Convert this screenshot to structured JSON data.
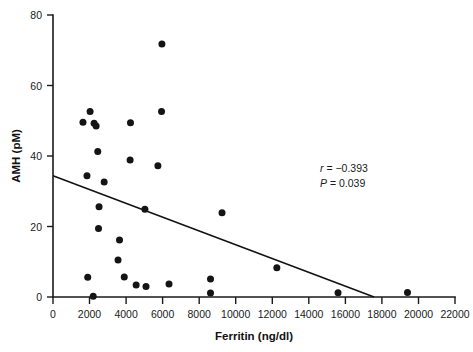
{
  "chart_data": {
    "type": "scatter",
    "title": "",
    "subtitle": "",
    "xlabel": "Ferritin (ng/dl)",
    "ylabel": "AMH (pM)",
    "xlim": [
      0,
      22000
    ],
    "ylim": [
      0,
      80
    ],
    "xticks": [
      0,
      2000,
      4000,
      6000,
      8000,
      10000,
      12000,
      14000,
      16000,
      18000,
      20000,
      22000
    ],
    "yticks": [
      0,
      20,
      40,
      60,
      80
    ],
    "xtick_labels": [
      "0",
      "2000",
      "4000",
      "6000",
      "8000",
      "10000",
      "12000",
      "14000",
      "16000",
      "18000",
      "20000",
      "22000"
    ],
    "ytick_labels": [
      "0",
      "20",
      "40",
      "60",
      "80"
    ],
    "grid": false,
    "legend": null,
    "marker": {
      "shape": "circle",
      "color": "#141414",
      "size_px": 7
    },
    "points": [
      {
        "x": 5960,
        "y": 71.8
      },
      {
        "x": 5940,
        "y": 52.6
      },
      {
        "x": 2030,
        "y": 52.6
      },
      {
        "x": 1640,
        "y": 49.6
      },
      {
        "x": 2250,
        "y": 49.3
      },
      {
        "x": 2360,
        "y": 48.5
      },
      {
        "x": 4240,
        "y": 49.4
      },
      {
        "x": 2450,
        "y": 41.3
      },
      {
        "x": 4220,
        "y": 38.9
      },
      {
        "x": 5740,
        "y": 37.2
      },
      {
        "x": 1860,
        "y": 34.4
      },
      {
        "x": 2800,
        "y": 32.6
      },
      {
        "x": 2520,
        "y": 25.6
      },
      {
        "x": 5030,
        "y": 24.9
      },
      {
        "x": 9250,
        "y": 23.9
      },
      {
        "x": 2490,
        "y": 19.4
      },
      {
        "x": 3640,
        "y": 16.2
      },
      {
        "x": 3560,
        "y": 10.5
      },
      {
        "x": 12250,
        "y": 8.3
      },
      {
        "x": 3900,
        "y": 5.7
      },
      {
        "x": 1900,
        "y": 5.6
      },
      {
        "x": 8620,
        "y": 5.1
      },
      {
        "x": 4550,
        "y": 3.4
      },
      {
        "x": 5090,
        "y": 3.0
      },
      {
        "x": 6350,
        "y": 3.7
      },
      {
        "x": 8620,
        "y": 1.1
      },
      {
        "x": 15600,
        "y": 1.2
      },
      {
        "x": 19400,
        "y": 1.3
      },
      {
        "x": 2200,
        "y": 0.2
      }
    ],
    "fit_line": {
      "x_start": 0,
      "y_start": 34.4,
      "x_end": 17570,
      "y_end": 0.0
    },
    "annotations": {
      "r_label": "r",
      "r_value": " = −0.393",
      "p_label": "P",
      "p_value": " = 0.039"
    }
  }
}
